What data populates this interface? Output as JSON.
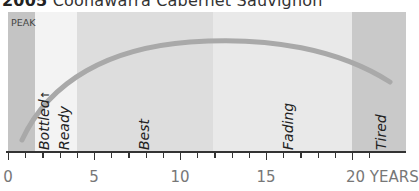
{
  "chart_data": {
    "type": "area",
    "title": "2005 Coonawarra Cabernet Sauvignon",
    "title_vintage": "2005",
    "title_name": "Coonawarra Cabernet Sauvignon",
    "xlabel": "YEARS",
    "ylabel": "",
    "xlim": [
      0,
      21
    ],
    "x_ticks": [
      0,
      1,
      2,
      3,
      4,
      5,
      6,
      7,
      8,
      9,
      10,
      11,
      12,
      13,
      14,
      15,
      16,
      17,
      18,
      19,
      20,
      21
    ],
    "x_tick_labels": [
      {
        "x": 0,
        "label": "0"
      },
      {
        "x": 5,
        "label": "5"
      },
      {
        "x": 10,
        "label": "10"
      },
      {
        "x": 15,
        "label": "15"
      },
      {
        "x": 20,
        "label": "20 YEARS"
      }
    ],
    "peak_label": "PEAK",
    "bands": [
      {
        "name": "Pre-bottling",
        "start": 0,
        "end": 1.6,
        "color": "#c4c4c4"
      },
      {
        "name": "Bottled / Ready",
        "start": 1.6,
        "end": 4,
        "color": "#f2f2f2"
      },
      {
        "name": "Best",
        "start": 4,
        "end": 12,
        "color": "#dcdcdc"
      },
      {
        "name": "Fading",
        "start": 12,
        "end": 20,
        "color": "#e8e8e8"
      },
      {
        "name": "Tired",
        "start": 20,
        "end": 21,
        "color": "#c8c8c8"
      }
    ],
    "stage_labels": [
      {
        "label": "Bottled",
        "x": 2,
        "marker": "↑"
      },
      {
        "label": "Ready",
        "x": 3
      },
      {
        "label": "Best",
        "x": 8
      },
      {
        "label": "Fading",
        "x": 16
      },
      {
        "label": "Tired",
        "x": 20.5
      }
    ],
    "curve": {
      "description": "Quality arc rising from bottling, peaking around year 10-11, declining to year 22",
      "points": [
        [
          0.8,
          0.08
        ],
        [
          2,
          0.45
        ],
        [
          4,
          0.7
        ],
        [
          6,
          0.83
        ],
        [
          8,
          0.9
        ],
        [
          10,
          0.92
        ],
        [
          12,
          0.9
        ],
        [
          14,
          0.85
        ],
        [
          16,
          0.77
        ],
        [
          18,
          0.65
        ],
        [
          19.5,
          0.52
        ],
        [
          22,
          0.5
        ]
      ],
      "color": "#a9a9a9"
    },
    "grid": false,
    "legend": null
  }
}
